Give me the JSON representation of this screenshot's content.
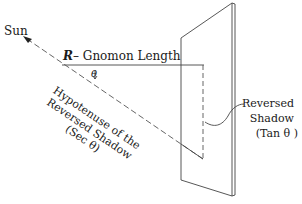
{
  "diagram": {
    "type": "sundial-gnomon-geometry",
    "labels": {
      "sun": "Sun",
      "gnomon_symbol": "R",
      "gnomon_text": "– Gnomon  Length",
      "angle": "θ",
      "hypotenuse_line1": "Hypotenuse of the",
      "hypotenuse_line2": "Reversed Shadow",
      "hypotenuse_line3": "(Sec θ)",
      "reversed_shadow_line1": "Reversed",
      "reversed_shadow_line2": "Shadow",
      "reversed_shadow_line3": "(Tan θ )"
    },
    "colors": {
      "line": "#333333",
      "text": "#1a1a1a",
      "background": "#ffffff"
    }
  }
}
